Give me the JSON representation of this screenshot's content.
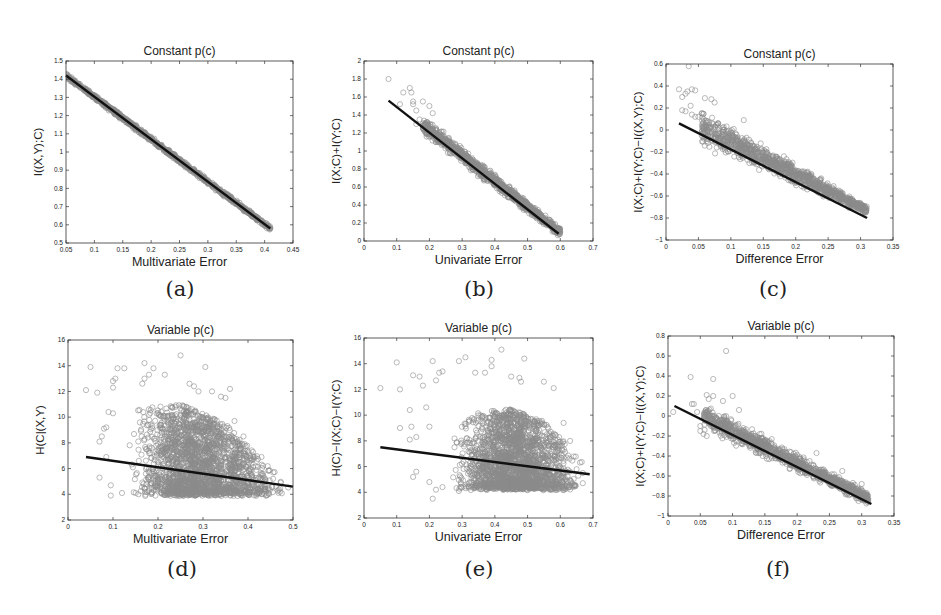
{
  "figure": {
    "panels": [
      {
        "id": "a",
        "caption": "(a)",
        "title": "Constant p(c)",
        "xlabel": "Multivariate Error",
        "ylabel": "I((X,Y);C)",
        "box": {
          "x": 66,
          "y": 61,
          "w": 227,
          "h": 182
        },
        "xlim": [
          0.05,
          0.45
        ],
        "ylim": [
          0.5,
          1.5
        ],
        "xticks": [
          "0.05",
          "0.1",
          "0.15",
          "0.2",
          "0.25",
          "0.3",
          "0.35",
          "0.4",
          "0.45"
        ],
        "yticks": [
          "0.5",
          "0.6",
          "0.7",
          "0.8",
          "0.9",
          "1",
          "1.1",
          "1.2",
          "1.3",
          "1.4",
          "1.5"
        ],
        "caption_pos": {
          "x": 140,
          "y": 277
        }
      },
      {
        "id": "b",
        "caption": "(b)",
        "title": "Constant p(c)",
        "xlabel": "Univariate Error",
        "ylabel": "I(X;C)+I(Y;C)",
        "box": {
          "x": 364,
          "y": 61,
          "w": 229,
          "h": 180
        },
        "xlim": [
          0,
          0.7
        ],
        "ylim": [
          0,
          2
        ],
        "xticks": [
          "0",
          "0.1",
          "0.2",
          "0.3",
          "0.4",
          "0.5",
          "0.6",
          "0.7"
        ],
        "yticks": [
          "0",
          "0.2",
          "0.4",
          "0.6",
          "0.8",
          "1",
          "1.2",
          "1.4",
          "1.6",
          "1.8",
          "2"
        ],
        "caption_pos": {
          "x": 439,
          "y": 277
        }
      },
      {
        "id": "c",
        "caption": "(c)",
        "title": "Constant p(c)",
        "xlabel": "Difference Error",
        "ylabel": "I(X;C)+I(Y;C)−I((X,Y);C)",
        "box": {
          "x": 666,
          "y": 64,
          "w": 227,
          "h": 176
        },
        "xlim": [
          0,
          0.35
        ],
        "ylim": [
          -1,
          0.6
        ],
        "xticks": [
          "0",
          "0.05",
          "0.1",
          "0.15",
          "0.2",
          "0.25",
          "0.3",
          "0.35"
        ],
        "yticks": [
          "−1",
          "−0.8",
          "−0.6",
          "−0.4",
          "−0.2",
          "0",
          "0.2",
          "0.4",
          "0.6"
        ],
        "caption_pos": {
          "x": 733,
          "y": 277
        }
      },
      {
        "id": "d",
        "caption": "(d)",
        "title": "Variable p(c)",
        "xlabel": "Multivariate Error",
        "ylabel": "H(C|(X,Y)",
        "box": {
          "x": 68,
          "y": 340,
          "w": 225,
          "h": 180
        },
        "xlim": [
          0,
          0.5
        ],
        "ylim": [
          2,
          16
        ],
        "xticks": [
          "0",
          "0.1",
          "0.2",
          "0.3",
          "0.4",
          "0.5"
        ],
        "yticks": [
          "2",
          "4",
          "6",
          "8",
          "10",
          "12",
          "14",
          "16"
        ],
        "caption_pos": {
          "x": 142,
          "y": 557
        }
      },
      {
        "id": "e",
        "caption": "(e)",
        "title": "Variable p(c)",
        "xlabel": "Univariate Error",
        "ylabel": "H(C)−I(X;C)−I(Y;C)",
        "box": {
          "x": 364,
          "y": 338,
          "w": 229,
          "h": 180
        },
        "xlim": [
          0,
          0.7
        ],
        "ylim": [
          2,
          16
        ],
        "xticks": [
          "0",
          "0.1",
          "0.2",
          "0.3",
          "0.4",
          "0.5",
          "0.6",
          "0.7"
        ],
        "yticks": [
          "2",
          "4",
          "6",
          "8",
          "10",
          "12",
          "14",
          "16"
        ],
        "caption_pos": {
          "x": 439,
          "y": 557
        }
      },
      {
        "id": "f",
        "caption": "(f)",
        "title": "Variable p(c)",
        "xlabel": "Difference Error",
        "ylabel": "I(X;C)+I(Y;C)−I((X,Y);C)",
        "box": {
          "x": 668,
          "y": 336,
          "w": 226,
          "h": 180
        },
        "xlim": [
          0,
          0.35
        ],
        "ylim": [
          -1,
          0.8
        ],
        "xticks": [
          "0",
          "0.05",
          "0.1",
          "0.15",
          "0.2",
          "0.25",
          "0.3",
          "0.35"
        ],
        "yticks": [
          "−1",
          "−0.8",
          "−0.6",
          "−0.4",
          "−0.2",
          "0",
          "0.2",
          "0.4",
          "0.6",
          "0.8"
        ],
        "caption_pos": {
          "x": 738,
          "y": 557
        }
      }
    ],
    "colors": {
      "marker": "#8a8a8a",
      "fit_line": "#111111",
      "axis": "#333333"
    }
  },
  "chart_data": [
    {
      "type": "scatter",
      "panel": "a",
      "title": "Constant p(c)",
      "xlabel": "Multivariate Error",
      "ylabel": "I((X,Y);C)",
      "xlim": [
        0.05,
        0.45
      ],
      "ylim": [
        0.5,
        1.5
      ],
      "grid": false,
      "legend": null,
      "fit_line": {
        "x": [
          0.05,
          0.41
        ],
        "y": [
          1.42,
          0.58
        ]
      },
      "scatter": {
        "x_range": [
          0.05,
          0.41
        ],
        "spread": 0.02,
        "outlier_rate": 0.0,
        "density": "tight band along fit line"
      },
      "gen": {
        "n": 900,
        "x0": 0.05,
        "x1": 0.41,
        "xmode": "uniform",
        "slope_pts": [
          [
            0.05,
            1.42
          ],
          [
            0.41,
            0.58
          ]
        ],
        "band_lo": 0.018,
        "band_hi": 0.018,
        "skew": 0,
        "outliers": []
      }
    },
    {
      "type": "scatter",
      "panel": "b",
      "title": "Constant p(c)",
      "xlabel": "Univariate Error",
      "ylabel": "I(X;C)+I(Y;C)",
      "xlim": [
        0,
        0.7
      ],
      "ylim": [
        0,
        2
      ],
      "grid": false,
      "legend": null,
      "fit_line": {
        "x": [
          0.075,
          0.595
        ],
        "y": [
          1.56,
          0.08
        ]
      },
      "scatter": {
        "x_range": [
          0.07,
          0.6
        ],
        "spread": 0.08,
        "density": "dense band, widening toward low x"
      },
      "gen": {
        "n": 1100,
        "x0": 0.18,
        "x1": 0.6,
        "xmode": "uniform",
        "slope_pts": [
          [
            0.075,
            1.56
          ],
          [
            0.595,
            0.08
          ]
        ],
        "band_lo": 0.06,
        "band_hi": 0.12,
        "skew": 0.03,
        "outliers": [
          [
            0.075,
            1.8
          ],
          [
            0.12,
            1.65
          ],
          [
            0.14,
            1.7
          ],
          [
            0.145,
            1.65
          ],
          [
            0.15,
            1.55
          ],
          [
            0.15,
            1.52
          ],
          [
            0.11,
            1.52
          ],
          [
            0.18,
            1.55
          ],
          [
            0.16,
            1.45
          ],
          [
            0.2,
            1.5
          ],
          [
            0.17,
            1.35
          ],
          [
            0.21,
            1.42
          ],
          [
            0.22,
            1.1
          ],
          [
            0.19,
            1.2
          ],
          [
            0.16,
            1.3
          ]
        ]
      }
    },
    {
      "type": "scatter",
      "panel": "c",
      "title": "Constant p(c)",
      "xlabel": "Difference Error",
      "ylabel": "I(X;C)+I(Y;C)-I((X,Y);C)",
      "xlim": [
        0,
        0.35
      ],
      "ylim": [
        -1,
        0.6
      ],
      "grid": false,
      "legend": null,
      "fit_line": {
        "x": [
          0.02,
          0.31
        ],
        "y": [
          0.06,
          -0.8
        ]
      },
      "scatter": {
        "x_range": [
          0.02,
          0.31
        ],
        "density": "dense band mostly above fit line"
      },
      "gen": {
        "n": 1100,
        "x0": 0.055,
        "x1": 0.31,
        "xmode": "uniform",
        "slope_pts": [
          [
            0.02,
            0.06
          ],
          [
            0.31,
            -0.8
          ]
        ],
        "band_lo": 0.05,
        "band_hi": 0.2,
        "skew": 0.07,
        "outliers": [
          [
            0.02,
            0.37
          ],
          [
            0.025,
            0.3
          ],
          [
            0.03,
            0.33
          ],
          [
            0.033,
            0.35
          ],
          [
            0.04,
            0.37
          ],
          [
            0.038,
            0.22
          ],
          [
            0.025,
            0.18
          ],
          [
            0.03,
            0.17
          ],
          [
            0.045,
            0.36
          ],
          [
            0.035,
            0.58
          ],
          [
            0.045,
            0.12
          ],
          [
            0.04,
            0.14
          ],
          [
            0.05,
            0.12
          ],
          [
            0.055,
            0.15
          ],
          [
            0.12,
            0.09
          ],
          [
            0.07,
            0.28
          ],
          [
            0.06,
            0.29
          ],
          [
            0.075,
            0.25
          ]
        ]
      }
    },
    {
      "type": "scatter",
      "panel": "d",
      "title": "Variable p(c)",
      "xlabel": "Multivariate Error",
      "ylabel": "H(C|(X,Y)",
      "xlim": [
        0,
        0.5
      ],
      "ylim": [
        2,
        16
      ],
      "grid": false,
      "legend": null,
      "fit_line": {
        "x": [
          0.04,
          0.5
        ],
        "y": [
          6.9,
          4.6
        ]
      },
      "scatter": {
        "x_range": [
          0.04,
          0.5
        ],
        "y_range": [
          3.9,
          14.8
        ],
        "density": "broad cloud peaking near x=0.25, floor near y=4"
      },
      "gen": {
        "n": 2200,
        "x0": 0.12,
        "x1": 0.5,
        "xmode": "peak",
        "peak": 0.27,
        "floor": 4.0,
        "floor_slope": 1.0,
        "ceil_pts": [
          [
            0.12,
            10.5
          ],
          [
            0.25,
            11.0
          ],
          [
            0.35,
            9.5
          ],
          [
            0.45,
            6.0
          ],
          [
            0.5,
            5.0
          ]
        ],
        "slope_pts": [
          [
            0.04,
            6.9
          ],
          [
            0.5,
            4.6
          ]
        ],
        "cloud": true,
        "outliers": [
          [
            0.04,
            12.1
          ],
          [
            0.05,
            13.9
          ],
          [
            0.065,
            11.9
          ],
          [
            0.07,
            8.1
          ],
          [
            0.08,
            9.1
          ],
          [
            0.085,
            9.2
          ],
          [
            0.075,
            8.5
          ],
          [
            0.09,
            10.4
          ],
          [
            0.1,
            12.8
          ],
          [
            0.1,
            12.3
          ],
          [
            0.105,
            13.0
          ],
          [
            0.11,
            13.8
          ],
          [
            0.1,
            10.3
          ],
          [
            0.125,
            13.8
          ],
          [
            0.095,
            3.9
          ],
          [
            0.12,
            4.1
          ],
          [
            0.17,
            14.2
          ],
          [
            0.19,
            13.8
          ],
          [
            0.215,
            13.3
          ],
          [
            0.25,
            14.8
          ],
          [
            0.305,
            13.9
          ],
          [
            0.165,
            12.6
          ],
          [
            0.17,
            13.0
          ],
          [
            0.18,
            13.3
          ],
          [
            0.27,
            12.6
          ],
          [
            0.28,
            12.4
          ],
          [
            0.32,
            12.0
          ],
          [
            0.36,
            12.2
          ],
          [
            0.29,
            12.0
          ],
          [
            0.34,
            11.6
          ],
          [
            0.35,
            11.5
          ],
          [
            0.37,
            9.7
          ],
          [
            0.39,
            8.5
          ],
          [
            0.43,
            6.9
          ],
          [
            0.07,
            5.3
          ],
          [
            0.085,
            6.9
          ],
          [
            0.095,
            4.7
          ]
        ]
      }
    },
    {
      "type": "scatter",
      "panel": "e",
      "title": "Variable p(c)",
      "xlabel": "Univariate Error",
      "ylabel": "H(C)-I(X;C)-I(Y;C)",
      "xlim": [
        0,
        0.7
      ],
      "ylim": [
        2,
        16
      ],
      "grid": false,
      "legend": null,
      "fit_line": {
        "x": [
          0.05,
          0.69
        ],
        "y": [
          7.5,
          5.4
        ]
      },
      "scatter": {
        "x_range": [
          0.05,
          0.69
        ],
        "y_range": [
          3.5,
          15.1
        ],
        "density": "broad cloud peaking near x=0.45, floor near y=4.3"
      },
      "gen": {
        "n": 2200,
        "x0": 0.25,
        "x1": 0.69,
        "xmode": "peak",
        "peak": 0.45,
        "floor": 4.3,
        "floor_slope": 1.0,
        "ceil_pts": [
          [
            0.25,
            9.0
          ],
          [
            0.35,
            10.2
          ],
          [
            0.45,
            10.5
          ],
          [
            0.55,
            9.5
          ],
          [
            0.63,
            7.5
          ],
          [
            0.69,
            5.6
          ]
        ],
        "slope_pts": [
          [
            0.05,
            7.5
          ],
          [
            0.69,
            5.4
          ]
        ],
        "cloud": true,
        "outliers": [
          [
            0.05,
            12.1
          ],
          [
            0.1,
            14.1
          ],
          [
            0.11,
            12.0
          ],
          [
            0.11,
            9.0
          ],
          [
            0.14,
            10.4
          ],
          [
            0.14,
            8.1
          ],
          [
            0.145,
            9.1
          ],
          [
            0.15,
            13.1
          ],
          [
            0.17,
            13.0
          ],
          [
            0.18,
            12.3
          ],
          [
            0.16,
            8.3
          ],
          [
            0.15,
            5.2
          ],
          [
            0.16,
            5.6
          ],
          [
            0.19,
            10.6
          ],
          [
            0.2,
            9.1
          ],
          [
            0.21,
            14.2
          ],
          [
            0.22,
            12.7
          ],
          [
            0.23,
            13.3
          ],
          [
            0.24,
            13.4
          ],
          [
            0.29,
            14.2
          ],
          [
            0.31,
            14.5
          ],
          [
            0.39,
            14.3
          ],
          [
            0.39,
            13.8
          ],
          [
            0.34,
            13.3
          ],
          [
            0.37,
            13.3
          ],
          [
            0.42,
            15.1
          ],
          [
            0.49,
            14.4
          ],
          [
            0.21,
            3.5
          ],
          [
            0.22,
            4.2
          ],
          [
            0.2,
            4.8
          ],
          [
            0.24,
            4.4
          ],
          [
            0.29,
            4.1
          ],
          [
            0.45,
            13.0
          ],
          [
            0.475,
            12.9
          ],
          [
            0.48,
            12.6
          ],
          [
            0.55,
            12.6
          ],
          [
            0.58,
            12.1
          ],
          [
            0.61,
            9.4
          ],
          [
            0.63,
            8.0
          ]
        ]
      }
    },
    {
      "type": "scatter",
      "panel": "f",
      "title": "Variable p(c)",
      "xlabel": "Difference Error",
      "ylabel": "I(X;C)+I(Y;C)-I((X,Y);C)",
      "xlim": [
        0,
        0.35
      ],
      "ylim": [
        -1,
        0.8
      ],
      "grid": false,
      "legend": null,
      "fit_line": {
        "x": [
          0.01,
          0.315
        ],
        "y": [
          0.1,
          -0.88
        ]
      },
      "scatter": {
        "x_range": [
          0.008,
          0.315
        ],
        "density": "dense band along and above fit line"
      },
      "gen": {
        "n": 1100,
        "x0": 0.055,
        "x1": 0.31,
        "xmode": "uniform",
        "slope_pts": [
          [
            0.01,
            0.1
          ],
          [
            0.315,
            -0.88
          ]
        ],
        "band_lo": 0.08,
        "band_hi": 0.16,
        "skew": 0.04,
        "outliers": [
          [
            0.008,
            0.04
          ],
          [
            0.035,
            0.39
          ],
          [
            0.037,
            0.12
          ],
          [
            0.04,
            0.12
          ],
          [
            0.045,
            0.04
          ],
          [
            0.07,
            0.37
          ],
          [
            0.09,
            0.65
          ],
          [
            0.1,
            0.2
          ],
          [
            0.085,
            0.15
          ],
          [
            0.06,
            0.21
          ],
          [
            0.063,
            0.17
          ],
          [
            0.05,
            -0.1
          ],
          [
            0.05,
            -0.15
          ],
          [
            0.055,
            -0.18
          ],
          [
            0.06,
            -0.2
          ],
          [
            0.07,
            0.2
          ],
          [
            0.11,
            0.06
          ],
          [
            0.23,
            -0.37
          ],
          [
            0.27,
            -0.55
          ],
          [
            0.3,
            -0.68
          ],
          [
            0.305,
            -0.8
          ],
          [
            0.31,
            -0.84
          ],
          [
            0.295,
            -0.85
          ]
        ]
      }
    }
  ]
}
